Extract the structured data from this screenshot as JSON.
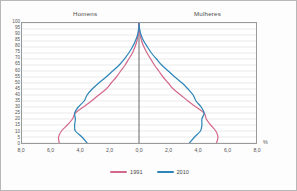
{
  "chart_data": {
    "type": "line",
    "title": "",
    "subtitle": "",
    "xlabel": "%",
    "ylabel": "",
    "grid": true,
    "legend_position": "bottom",
    "orientation": "population-pyramid",
    "side_labels": {
      "left": "Homens",
      "right": "Mulheres"
    },
    "xlim": [
      -8.0,
      8.0
    ],
    "ylim": [
      0,
      100
    ],
    "x_tick_labels": [
      "8,0",
      "6,0",
      "4,0",
      "2,0",
      "0,0",
      "2,0",
      "4,0",
      "6,0",
      "8,0"
    ],
    "x_tick_values": [
      -8.0,
      -6.0,
      -4.0,
      -2.0,
      0.0,
      2.0,
      4.0,
      6.0,
      8.0
    ],
    "y_tick_labels": [
      "100",
      "95",
      "90",
      "85",
      "80",
      "75",
      "70",
      "65",
      "60",
      "55",
      "50",
      "45",
      "40",
      "35",
      "30",
      "25",
      "20",
      "15",
      "10",
      "5",
      "0"
    ],
    "y_tick_values": [
      100,
      95,
      90,
      85,
      80,
      75,
      70,
      65,
      60,
      55,
      50,
      45,
      40,
      35,
      30,
      25,
      20,
      15,
      10,
      5,
      0
    ],
    "age_groups": [
      0,
      5,
      10,
      15,
      20,
      25,
      30,
      35,
      40,
      45,
      50,
      55,
      60,
      65,
      70,
      75,
      80,
      85,
      90,
      95,
      100
    ],
    "series": [
      {
        "name": "1991",
        "color": "#d4698c",
        "side": "left",
        "group": "Homens",
        "values": [
          5.45,
          5.5,
          5.3,
          4.9,
          4.55,
          4.35,
          3.8,
          3.25,
          2.75,
          2.25,
          1.9,
          1.55,
          1.25,
          0.95,
          0.7,
          0.45,
          0.28,
          0.14,
          0.06,
          0.02,
          0.0
        ]
      },
      {
        "name": "2010",
        "color": "#2e86b8",
        "side": "left",
        "group": "Homens",
        "values": [
          3.55,
          3.9,
          4.35,
          4.4,
          4.35,
          4.4,
          4.15,
          3.75,
          3.55,
          3.2,
          2.75,
          2.25,
          1.8,
          1.35,
          1.0,
          0.7,
          0.45,
          0.25,
          0.1,
          0.03,
          0.0
        ]
      },
      {
        "name": "1991",
        "color": "#d4698c",
        "side": "right",
        "group": "Mulheres",
        "values": [
          5.3,
          5.4,
          5.25,
          4.9,
          4.6,
          4.45,
          3.9,
          3.35,
          2.85,
          2.35,
          2.0,
          1.65,
          1.35,
          1.05,
          0.8,
          0.55,
          0.34,
          0.18,
          0.08,
          0.03,
          0.0
        ]
      },
      {
        "name": "2010",
        "color": "#2e86b8",
        "side": "right",
        "group": "Mulheres",
        "values": [
          3.45,
          3.8,
          4.2,
          4.3,
          4.3,
          4.45,
          4.25,
          3.9,
          3.7,
          3.35,
          2.95,
          2.45,
          2.0,
          1.55,
          1.2,
          0.85,
          0.58,
          0.32,
          0.14,
          0.04,
          0.0
        ]
      }
    ],
    "legend": [
      {
        "label": "1991",
        "color": "#d4698c"
      },
      {
        "label": "2010",
        "color": "#2e86b8"
      }
    ]
  },
  "colors": {
    "series_1991": "#d4698c",
    "series_2010": "#2e86b8",
    "grid": "#dcdcdc",
    "axis": "#9a9a9a",
    "center_axis": "#555555",
    "text": "#4a4a4a",
    "background": "#ffffff",
    "frame": "#b8b8b8"
  }
}
